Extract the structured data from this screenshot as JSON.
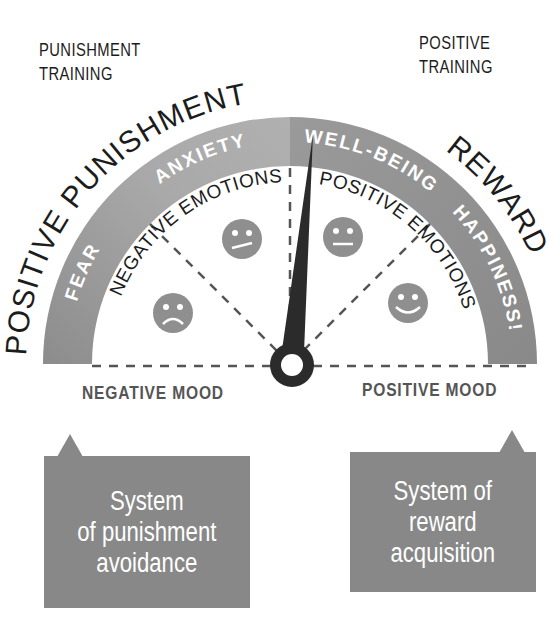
{
  "corners": {
    "left": {
      "line1": "PUNISHMENT",
      "line2": "TRAINING"
    },
    "right": {
      "line1": "POSITIVE",
      "line2": "TRAINING"
    }
  },
  "gauge": {
    "outer_labels": {
      "left": "POSITIVE PUNISHMENT",
      "right": "REWARD"
    },
    "band_labels": {
      "fear": "FEAR",
      "anxiety": "ANXIETY",
      "well_being": "WELL-BEING",
      "happiness": "HAPPINESS!"
    },
    "inner_labels": {
      "negative": "NEGATIVE EMOTIONS",
      "positive": "POSITIVE EMOTIONS"
    },
    "faces": [
      "sad",
      "confused",
      "neutral",
      "happy"
    ],
    "needle": "pointer",
    "colors": {
      "band_light": "#a9a9a9",
      "band_dark": "#8d8d8d",
      "needle": "#2b2b2b",
      "face": "#8f8f8f"
    }
  },
  "moods": {
    "negative": "NEGATIVE MOOD",
    "positive": "POSITIVE MOOD"
  },
  "bubbles": {
    "left": "System\nof punishment\navoidance",
    "right": "System of\nreward\nacquisition"
  }
}
